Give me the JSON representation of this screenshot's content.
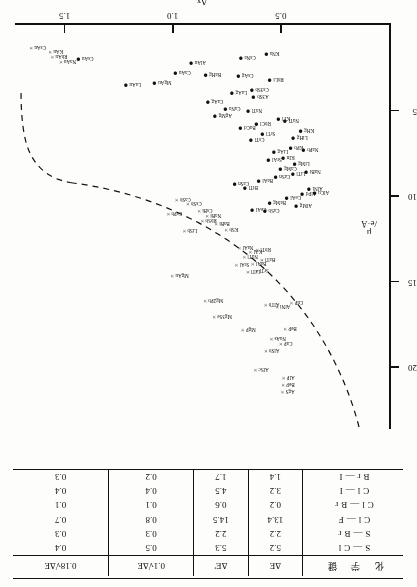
{
  "figure": {
    "orientation_note": "upside-down scan",
    "axes": {
      "x": {
        "label": "Δx",
        "ticks": [
          "0.5",
          "1.0",
          "1.5"
        ],
        "tick_values": [
          0.5,
          1.0,
          1.5
        ],
        "range": [
          0,
          1.72
        ]
      },
      "y": {
        "label_line1": "μ",
        "label_line2": "/e·Å",
        "label": "μ/e·Å",
        "ticks": [
          "5",
          "10",
          "15",
          "20"
        ],
        "tick_values": [
          5,
          10,
          15,
          20
        ],
        "range": [
          0,
          23.5
        ]
      }
    },
    "legend_markers": {
      "filled_circle": "●",
      "cross": "×"
    },
    "curve": "dashed boundary curve separating ionic (●) from metallic/covalent (×) compounds"
  },
  "chart_data": {
    "type": "scatter",
    "title": "",
    "xlabel": "Δx",
    "ylabel": "μ/e·Å",
    "xlim": [
      0,
      1.72
    ],
    "ylim": [
      0,
      23.5
    ],
    "grid": false,
    "legend_position": "none",
    "series": [
      {
        "name": "ionic compounds",
        "marker": "●",
        "points": [
          {
            "label": "CsAu",
            "x": 1.38,
            "y": 2.0
          },
          {
            "label": "LaAu",
            "x": 1.16,
            "y": 3.5
          },
          {
            "label": "MgAu",
            "x": 1.02,
            "y": 3.4
          },
          {
            "label": "AlAu",
            "x": 0.86,
            "y": 2.2
          },
          {
            "label": "CsNa",
            "x": 0.63,
            "y": 1.9
          },
          {
            "label": "KNa",
            "x": 0.52,
            "y": 1.7
          },
          {
            "label": "BaHg",
            "x": 0.79,
            "y": 2.9
          },
          {
            "label": "CaAu",
            "x": 0.93,
            "y": 2.8
          },
          {
            "label": "CsAg",
            "x": 0.64,
            "y": 3.0
          },
          {
            "label": "RbLi",
            "x": 0.5,
            "y": 3.2
          },
          {
            "label": "LaAg",
            "x": 0.67,
            "y": 4.0
          },
          {
            "label": "Cs3Sb",
            "x": 0.57,
            "y": 3.8
          },
          {
            "label": "A3Sb",
            "x": 0.57,
            "y": 4.2
          },
          {
            "label": "CaAg",
            "x": 0.78,
            "y": 4.5
          },
          {
            "label": "CaNa",
            "x": 0.7,
            "y": 4.9
          },
          {
            "label": "AgMg",
            "x": 0.74,
            "y": 5.3
          },
          {
            "label": "KTl",
            "x": 0.47,
            "y": 5.5
          },
          {
            "label": "NaTl",
            "x": 0.43,
            "y": 5.6
          },
          {
            "label": "RbCl",
            "x": 0.56,
            "y": 5.8
          },
          {
            "label": "BaCd",
            "x": 0.63,
            "y": 6.0
          },
          {
            "label": "KHg",
            "x": 0.36,
            "y": 6.2
          },
          {
            "label": "SrTl",
            "x": 0.54,
            "y": 6.4
          },
          {
            "label": "LiHg",
            "x": 0.39,
            "y": 6.6
          },
          {
            "label": "CsTl",
            "x": 0.59,
            "y": 6.7
          },
          {
            "label": "NaPb",
            "x": 0.34,
            "y": 7.3
          },
          {
            "label": "KPb",
            "x": 0.41,
            "y": 7.2
          },
          {
            "label": "LiAg",
            "x": 0.48,
            "y": 7.4
          },
          {
            "label": "KIn",
            "x": 0.45,
            "y": 7.8
          },
          {
            "label": "SrAl",
            "x": 0.51,
            "y": 7.9
          },
          {
            "label": "LiMg",
            "x": 0.38,
            "y": 8.1
          },
          {
            "label": "CaMg",
            "x": 0.44,
            "y": 8.4
          },
          {
            "label": "NaBi",
            "x": 0.33,
            "y": 8.6
          },
          {
            "label": "LiTl",
            "x": 0.4,
            "y": 8.7
          },
          {
            "label": "CaSn",
            "x": 0.47,
            "y": 8.9
          },
          {
            "label": "BaAl",
            "x": 0.55,
            "y": 9.1
          },
          {
            "label": "AlNi",
            "x": 0.32,
            "y": 9.6
          },
          {
            "label": "AlCu",
            "x": 0.29,
            "y": 9.8
          },
          {
            "label": "AlPd",
            "x": 0.35,
            "y": 9.9
          },
          {
            "label": "CeAl",
            "x": 0.42,
            "y": 10.1
          },
          {
            "label": "BaMg",
            "x": 0.49,
            "y": 10.4
          },
          {
            "label": "AlMg",
            "x": 0.37,
            "y": 10.6
          },
          {
            "label": "CaSb",
            "x": 0.52,
            "y": 10.9
          },
          {
            "label": "NaTl",
            "x": 0.6,
            "y": 5.0
          },
          {
            "label": "CaSn",
            "x": 0.66,
            "y": 9.3
          },
          {
            "label": "BiTl",
            "x": 0.62,
            "y": 9.5
          },
          {
            "label": "CeAl",
            "x": 0.58,
            "y": 10.8
          }
        ]
      },
      {
        "name": "metallic / covalent compounds",
        "marker": "×",
        "points": [
          {
            "label": "CsAu",
            "x": 1.6,
            "y": 1.3
          },
          {
            "label": "KAu",
            "x": 1.52,
            "y": 1.5
          },
          {
            "label": "NaAu",
            "x": 1.46,
            "y": 2.1
          },
          {
            "label": "RbAu",
            "x": 1.5,
            "y": 1.8
          },
          {
            "label": "CsBi",
            "x": 0.83,
            "y": 10.8
          },
          {
            "label": "NaBi",
            "x": 0.79,
            "y": 11.1
          },
          {
            "label": "RbSb",
            "x": 0.81,
            "y": 11.4
          },
          {
            "label": "BaBi",
            "x": 0.75,
            "y": 11.6
          },
          {
            "label": "KSb",
            "x": 0.71,
            "y": 11.9
          },
          {
            "label": "CsSb",
            "x": 0.88,
            "y": 10.4
          },
          {
            "label": "CaSb",
            "x": 0.93,
            "y": 10.2
          },
          {
            "label": "CsPb",
            "x": 0.97,
            "y": 11.0
          },
          {
            "label": "LiSb",
            "x": 0.9,
            "y": 12.0
          },
          {
            "label": "NaAl",
            "x": 0.64,
            "y": 13.0
          },
          {
            "label": "KAl",
            "x": 0.6,
            "y": 13.2
          },
          {
            "label": "RbTl",
            "x": 0.56,
            "y": 13.1
          },
          {
            "label": "NaTl",
            "x": 0.62,
            "y": 13.5
          },
          {
            "label": "BaAl",
            "x": 0.58,
            "y": 13.9
          },
          {
            "label": "SrAl",
            "x": 0.66,
            "y": 14.0
          },
          {
            "label": "BaTl",
            "x": 0.54,
            "y": 13.7
          },
          {
            "label": "LiTl",
            "x": 0.61,
            "y": 14.4
          },
          {
            "label": "SrTl",
            "x": 0.57,
            "y": 14.3
          },
          {
            "label": "MgAu",
            "x": 0.94,
            "y": 14.6
          },
          {
            "label": "AlTb",
            "x": 0.52,
            "y": 16.3
          },
          {
            "label": "AlNi",
            "x": 0.47,
            "y": 16.4
          },
          {
            "label": "CuP",
            "x": 0.41,
            "y": 16.2
          },
          {
            "label": "MgP",
            "x": 0.63,
            "y": 17.8
          },
          {
            "label": "BeP",
            "x": 0.44,
            "y": 17.7
          },
          {
            "label": "NaAs",
            "x": 0.49,
            "y": 18.3
          },
          {
            "label": "CaP",
            "x": 0.46,
            "y": 18.6
          },
          {
            "label": "Mg3Se",
            "x": 0.74,
            "y": 17.0
          },
          {
            "label": "Mg2Pb",
            "x": 0.78,
            "y": 16.1
          },
          {
            "label": "AlSc",
            "x": 0.57,
            "y": 20.1
          },
          {
            "label": "AlP",
            "x": 0.45,
            "y": 20.6
          },
          {
            "label": "BeP",
            "x": 0.45,
            "y": 21.0
          },
          {
            "label": "AgS",
            "x": 0.45,
            "y": 21.4
          },
          {
            "label": "AlSb",
            "x": 0.52,
            "y": 19.0
          }
        ]
      }
    ]
  },
  "table": {
    "headers": {
      "bond": "化 学 键",
      "de": "ΔE",
      "de_prime": "ΔE'",
      "c1": "0.1√ΔE",
      "c2": "0.18√ΔE"
    },
    "rows": [
      {
        "bond": "S—Cl",
        "de": "5.2",
        "de_prime": "5.3",
        "c1": "0.5",
        "c2": "0.4"
      },
      {
        "bond": "S—Br",
        "de": "2.2",
        "de_prime": "2.2",
        "c1": "0.3",
        "c2": "0.3"
      },
      {
        "bond": "Cl—F",
        "de": "13.4",
        "de_prime": "14.5",
        "c1": "0.8",
        "c2": "0.7"
      },
      {
        "bond": "Cl—Br",
        "de": "0.2",
        "de_prime": "0.6",
        "c1": "0.1",
        "c2": "0.1"
      },
      {
        "bond": "Cl—I",
        "de": "3.2",
        "de_prime": "4.5",
        "c1": "0.4",
        "c2": "0.4"
      },
      {
        "bond": "Br—I",
        "de": "1.4",
        "de_prime": "1.7",
        "c1": "0.2",
        "c2": "0.3"
      }
    ]
  },
  "colors": {
    "ink": "#111111",
    "paper": "#fdfdfb"
  }
}
